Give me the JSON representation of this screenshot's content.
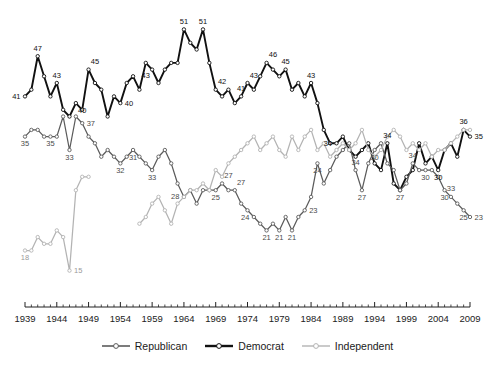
{
  "chart_data": {
    "type": "line",
    "title": "",
    "subtitle": "",
    "xlabel": "",
    "ylabel": "",
    "xlim": [
      1939,
      2009
    ],
    "ylim": [
      13,
      53
    ],
    "grid": false,
    "legend_position": "bottom",
    "x_tick_labels": [
      "1939",
      "1944",
      "1949",
      "1954",
      "1959",
      "1964",
      "1969",
      "1974",
      "1979",
      "1984",
      "1989",
      "1994",
      "1999",
      "2004",
      "2009"
    ],
    "x_tick_values": [
      1939,
      1944,
      1949,
      1954,
      1959,
      1964,
      1969,
      1974,
      1979,
      1984,
      1989,
      1994,
      1999,
      2004,
      2009
    ],
    "minor_ticks_per_interval": 5,
    "series": [
      {
        "name": "Democrat",
        "color": "#111111",
        "width": 1.9,
        "marker": "open-circle",
        "x": [
          1939,
          1940,
          1941,
          1942,
          1943,
          1944,
          1945,
          1946,
          1947,
          1948,
          1949,
          1950,
          1951,
          1952,
          1953,
          1954,
          1955,
          1956,
          1957,
          1958,
          1959,
          1960,
          1961,
          1962,
          1963,
          1964,
          1965,
          1966,
          1967,
          1968,
          1969,
          1970,
          1971,
          1972,
          1973,
          1974,
          1975,
          1976,
          1977,
          1978,
          1979,
          1980,
          1981,
          1982,
          1983,
          1984,
          1985,
          1986,
          1987,
          1988,
          1989,
          1990,
          1991,
          1992,
          1993,
          1994,
          1995,
          1996,
          1997,
          1998,
          1999,
          2000,
          2001,
          2002,
          2003,
          2004,
          2005,
          2006,
          2007,
          2008,
          2009
        ],
        "y": [
          41,
          42,
          47,
          44,
          41,
          43,
          39,
          38,
          40,
          39,
          45,
          43,
          42,
          38,
          41,
          40,
          43,
          44,
          42,
          46,
          45,
          43,
          45,
          46,
          46,
          51,
          49,
          48,
          51,
          46,
          42,
          41,
          42,
          40,
          41,
          43,
          42,
          44,
          46,
          45,
          44,
          45,
          42,
          43,
          41,
          43,
          40,
          36,
          34,
          34,
          35,
          33,
          32,
          33,
          34,
          31,
          30,
          34,
          28,
          27,
          29,
          30,
          34,
          31,
          32,
          30,
          33,
          34,
          32,
          36,
          35
        ],
        "labels": [
          {
            "x": 1939,
            "y": 41,
            "text": "41",
            "pos": "left"
          },
          {
            "x": 1941,
            "y": 47,
            "text": "47",
            "pos": "above"
          },
          {
            "x": 1944,
            "y": 43,
            "text": "43",
            "pos": "above"
          },
          {
            "x": 1948,
            "y": 40,
            "text": "40",
            "pos": "below"
          },
          {
            "x": 1950,
            "y": 45,
            "text": "45",
            "pos": "above"
          },
          {
            "x": 1954,
            "y": 40,
            "text": "40",
            "pos": "right"
          },
          {
            "x": 1958,
            "y": 43,
            "text": "43",
            "pos": "above"
          },
          {
            "x": 1964,
            "y": 51,
            "text": "51",
            "pos": "above"
          },
          {
            "x": 1967,
            "y": 51,
            "text": "51",
            "pos": "above"
          },
          {
            "x": 1970,
            "y": 42,
            "text": "42",
            "pos": "above"
          },
          {
            "x": 1973,
            "y": 41,
            "text": "41",
            "pos": "above"
          },
          {
            "x": 1975,
            "y": 43,
            "text": "43",
            "pos": "above"
          },
          {
            "x": 1978,
            "y": 46,
            "text": "46",
            "pos": "above"
          },
          {
            "x": 1980,
            "y": 45,
            "text": "45",
            "pos": "above"
          },
          {
            "x": 1984,
            "y": 43,
            "text": "43",
            "pos": "above"
          },
          {
            "x": 1988,
            "y": 34,
            "text": "34",
            "pos": "left"
          },
          {
            "x": 1996,
            "y": 34,
            "text": "34",
            "pos": "above"
          },
          {
            "x": 2004,
            "y": 30,
            "text": "30",
            "pos": "below"
          },
          {
            "x": 2008,
            "y": 36,
            "text": "36",
            "pos": "above"
          },
          {
            "x": 2009,
            "y": 35,
            "text": "35",
            "pos": "right"
          }
        ]
      },
      {
        "name": "Republican",
        "color": "#5b5b5b",
        "width": 1.25,
        "marker": "open-circle",
        "x": [
          1939,
          1940,
          1941,
          1942,
          1943,
          1944,
          1945,
          1946,
          1947,
          1948,
          1949,
          1950,
          1951,
          1952,
          1953,
          1954,
          1955,
          1956,
          1957,
          1958,
          1959,
          1960,
          1961,
          1962,
          1963,
          1964,
          1965,
          1966,
          1967,
          1968,
          1969,
          1970,
          1971,
          1972,
          1973,
          1974,
          1975,
          1976,
          1977,
          1978,
          1979,
          1980,
          1981,
          1982,
          1983,
          1984,
          1985,
          1986,
          1987,
          1988,
          1989,
          1990,
          1991,
          1992,
          1993,
          1994,
          1995,
          1996,
          1997,
          1998,
          1999,
          2000,
          2001,
          2002,
          2003,
          2004,
          2005,
          2006,
          2007,
          2008,
          2009
        ],
        "y": [
          35,
          36,
          36,
          35,
          35,
          35,
          38,
          33,
          38,
          37,
          35,
          34,
          32,
          33,
          32,
          31,
          32,
          33,
          32,
          31,
          30,
          32,
          33,
          31,
          28,
          26,
          27,
          25,
          27,
          27,
          27,
          28,
          27,
          27,
          25,
          24,
          23,
          22,
          21,
          22,
          21,
          23,
          21,
          23,
          24,
          26,
          31,
          28,
          30,
          32,
          33,
          34,
          30,
          27,
          31,
          33,
          34,
          31,
          30,
          27,
          28,
          31,
          30,
          30,
          30,
          29,
          27,
          26,
          25,
          24,
          23
        ],
        "labels": [
          {
            "x": 1939,
            "y": 35,
            "text": "35",
            "pos": "below"
          },
          {
            "x": 1943,
            "y": 35,
            "text": "35",
            "pos": "below"
          },
          {
            "x": 1946,
            "y": 33,
            "text": "33",
            "pos": "below"
          },
          {
            "x": 1948,
            "y": 37,
            "text": "37",
            "pos": "right"
          },
          {
            "x": 1954,
            "y": 31,
            "text": "32",
            "pos": "below"
          },
          {
            "x": 1956,
            "y": 33,
            "text": "31",
            "pos": "below"
          },
          {
            "x": 1959,
            "y": 30,
            "text": "33",
            "pos": "below"
          },
          {
            "x": 1964,
            "y": 26,
            "text": "28",
            "pos": "left"
          },
          {
            "x": 1969,
            "y": 27,
            "text": "25",
            "pos": "below"
          },
          {
            "x": 1971,
            "y": 28,
            "text": "27",
            "pos": "above"
          },
          {
            "x": 1973,
            "y": 27,
            "text": "27",
            "pos": "above"
          },
          {
            "x": 1975,
            "y": 23,
            "text": "24",
            "pos": "left"
          },
          {
            "x": 1977,
            "y": 21,
            "text": "21",
            "pos": "below"
          },
          {
            "x": 1979,
            "y": 21,
            "text": "21",
            "pos": "below"
          },
          {
            "x": 1981,
            "y": 21,
            "text": "21",
            "pos": "below"
          },
          {
            "x": 1983,
            "y": 24,
            "text": "23",
            "pos": "right"
          },
          {
            "x": 1985,
            "y": 31,
            "text": "24",
            "pos": "below"
          },
          {
            "x": 1991,
            "y": 30,
            "text": "34",
            "pos": "above"
          },
          {
            "x": 1992,
            "y": 27,
            "text": "27",
            "pos": "below"
          },
          {
            "x": 1994,
            "y": 33,
            "text": "30",
            "pos": "below"
          },
          {
            "x": 1998,
            "y": 27,
            "text": "27",
            "pos": "below"
          },
          {
            "x": 2000,
            "y": 31,
            "text": "34",
            "pos": "above"
          },
          {
            "x": 2002,
            "y": 30,
            "text": "30",
            "pos": "below"
          },
          {
            "x": 2005,
            "y": 27,
            "text": "30",
            "pos": "below"
          },
          {
            "x": 2006,
            "y": 26,
            "text": "33",
            "pos": "above"
          },
          {
            "x": 2008,
            "y": 24,
            "text": "25",
            "pos": "below"
          },
          {
            "x": 2009,
            "y": 23,
            "text": "23",
            "pos": "right"
          }
        ]
      },
      {
        "name": "Independent",
        "color": "#b3b3b3",
        "width": 1.25,
        "marker": "open-circle",
        "segments": [
          {
            "x": [
              1939,
              1940,
              1941,
              1942,
              1943,
              1944,
              1945,
              1946,
              1947,
              1948,
              1949
            ],
            "y": [
              18,
              18,
              20,
              19,
              19,
              21,
              20,
              15,
              27,
              29,
              29,
              25
            ],
            "labels": [
              {
                "x": 1939,
                "y": 18,
                "text": "18",
                "pos": "below"
              },
              {
                "x": 1946,
                "y": 15,
                "text": "15",
                "pos": "right"
              }
            ]
          },
          {
            "x": [
              1957,
              1958,
              1959,
              1960,
              1961,
              1962,
              1963,
              1964,
              1965,
              1966,
              1967,
              1968,
              1969,
              1970,
              1971,
              1972,
              1973,
              1974,
              1975,
              1976,
              1977,
              1978,
              1979,
              1980,
              1981,
              1982,
              1983,
              1984,
              1985,
              1986,
              1987,
              1988,
              1989,
              1990,
              1991,
              1992,
              1993,
              1994,
              1995,
              1996,
              1997,
              1998,
              1999,
              2000,
              2001,
              2002,
              2003,
              2004,
              2005,
              2006,
              2007,
              2008,
              2009
            ],
            "y": [
              22,
              23,
              25,
              26,
              24,
              22,
              25,
              26,
              27,
              27,
              28,
              27,
              30,
              29,
              31,
              32,
              33,
              34,
              35,
              33,
              34,
              35,
              33,
              32,
              35,
              33,
              35,
              36,
              33,
              34,
              32,
              33,
              34,
              33,
              34,
              36,
              33,
              32,
              33,
              35,
              36,
              35,
              33,
              34,
              33,
              34,
              32,
              33,
              33,
              34,
              35,
              36,
              36
            ],
            "labels": []
          }
        ]
      }
    ]
  },
  "legend": {
    "items": [
      {
        "label": "Republican",
        "color": "#5b5b5b",
        "width": 1.6
      },
      {
        "label": "Democrat",
        "color": "#111111",
        "width": 2.4
      },
      {
        "label": "Independent",
        "color": "#b3b3b3",
        "width": 1.4
      }
    ]
  },
  "axis": {
    "line_color": "#222222"
  }
}
